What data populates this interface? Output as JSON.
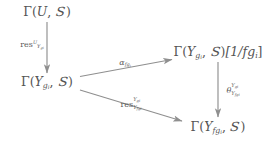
{
  "diagram": {
    "type": "commutative-diagram",
    "colors": {
      "text": "#545454",
      "arrow": "#8a8a8a",
      "background": "#ffffff"
    },
    "nodes": [
      {
        "id": "gamma-U-S",
        "name": "gamma-U-S",
        "latex": "\\Gamma(U,\\mathscr{S})",
        "plain": "Γ(U, 𝒮)",
        "parts": {
          "gamma": "Γ",
          "open": "(",
          "arg1": "U",
          "comma": ", ",
          "sheaf": "S",
          "close": ")",
          "suffix": ""
        },
        "x": 47,
        "y": 12
      },
      {
        "id": "gamma-Ygi-S",
        "name": "gamma-Ygi-S",
        "latex": "\\Gamma(Y_{g_i},\\mathscr{S})",
        "plain": "Γ(Y_{g_i}, 𝒮)",
        "parts": {
          "gamma": "Γ",
          "open": "(",
          "arg1": "Y",
          "sub1": "g",
          "sub2": "i",
          "comma": ", ",
          "sheaf": "S",
          "close": ")",
          "suffix": ""
        },
        "x": 47,
        "y": 82
      },
      {
        "id": "gamma-Ygi-S-loc",
        "name": "gamma-Ygi-S-localized",
        "latex": "\\Gamma(Y_{g_i},\\mathscr{S})[1/fg_i]",
        "plain": "Γ(Y_{g_i}, 𝒮)[1/fg_i]",
        "parts": {
          "gamma": "Γ",
          "open": "(",
          "arg1": "Y",
          "sub1": "g",
          "sub2": "i",
          "comma": ", ",
          "sheaf": "S",
          "close": ")",
          "suffix": "[1/fg",
          "suffix_sub": "i",
          "suffix_end": "]"
        },
        "x": 218,
        "y": 52
      },
      {
        "id": "gamma-Yfgi-S",
        "name": "gamma-Yfgi-S",
        "latex": "\\Gamma(Y_{fg_i},\\mathscr{S})",
        "plain": "Γ(Y_{fg_i}, 𝒮)",
        "parts": {
          "gamma": "Γ",
          "open": "(",
          "arg1": "Y",
          "sub1": "fg",
          "sub2": "i",
          "comma": ", ",
          "sheaf": "S",
          "close": ")",
          "suffix": ""
        },
        "x": 218,
        "y": 127
      }
    ],
    "arrows": [
      {
        "id": "arrow-res-U-Ygi",
        "name": "arrow-restriction-U-to-Ygi",
        "from": "gamma-U-S",
        "to": "gamma-Ygi-S",
        "x1": 47,
        "y1": 22,
        "x2": 47,
        "y2": 73,
        "label": {
          "id": "label-res-U-Ygi",
          "name": "label-restriction-U-to-Ygi",
          "latex": "\\mathrm{res}^{U}_{Y_{g_i}}",
          "plain": "res^U_{Y_gi}",
          "op": "res",
          "sup": "U",
          "sub_base": "Y",
          "sub_sub1": "g",
          "sub_sub2": "i",
          "x": 32,
          "y": 45
        }
      },
      {
        "id": "arrow-alpha-fgi",
        "name": "arrow-alpha-localization",
        "from": "gamma-Ygi-S",
        "to": "gamma-Ygi-S-loc",
        "x1": 80,
        "y1": 76,
        "x2": 172,
        "y2": 60,
        "label": {
          "id": "label-alpha-fgi",
          "name": "label-alpha-fgi",
          "latex": "\\alpha_{fg_i}",
          "plain": "α_{fg_i}",
          "op": "α",
          "sup": "",
          "sub_base": "fg",
          "sub_sub1": "i",
          "sub_sub2": "",
          "x": 125,
          "y": 63
        }
      },
      {
        "id": "arrow-res-Ygi-Yfgi",
        "name": "arrow-restriction-Ygi-to-Yfgi",
        "from": "gamma-Ygi-S",
        "to": "gamma-Yfgi-S",
        "x1": 80,
        "y1": 90,
        "x2": 182,
        "y2": 121,
        "label": {
          "id": "label-res-Ygi-Yfgi",
          "name": "label-restriction-Ygi-to-Yfgi",
          "latex": "\\mathrm{res}^{Y_{g_i}}_{Y_{fg_i}}",
          "plain": "res^{Y_gi}_{Y_fgi}",
          "op": "res",
          "sup_base": "Y",
          "sup_sub": "g",
          "sup_sub2": "i",
          "sub_base": "Y",
          "sub_sub1": "fg",
          "sub_sub2": "i",
          "x": 131,
          "y": 105
        }
      },
      {
        "id": "arrow-theta",
        "name": "arrow-theta-Ygi-Yfgi",
        "from": "gamma-Ygi-S-loc",
        "to": "gamma-Yfgi-S",
        "x1": 218,
        "y1": 62,
        "x2": 218,
        "y2": 117,
        "label": {
          "id": "label-theta",
          "name": "label-theta-Ygi-Yfgi",
          "latex": "\\theta^{Y_{g_i}}_{Y_{fg_i}}",
          "plain": "θ^{Y_gi}_{Y_fgi}",
          "op": "θ",
          "sup_base": "Y",
          "sup_sub": "g",
          "sup_sub2": "i",
          "sub_base": "Y",
          "sub_sub1": "fg",
          "sub_sub2": "i",
          "x": 233,
          "y": 91
        }
      }
    ]
  }
}
